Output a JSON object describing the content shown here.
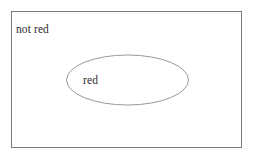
{
  "diagram": {
    "type": "euler-diagram",
    "background_color": "#ffffff",
    "universe": {
      "label": "not red",
      "shape": "rectangle",
      "stroke_color": "#7a7a7a",
      "fill": "none",
      "x": 11,
      "y": 11,
      "width": 230,
      "height": 136,
      "label_x": 16,
      "label_y": 33
    },
    "sets": [
      {
        "label": "red",
        "shape": "ellipse",
        "stroke_color": "#8e8e8e",
        "fill": "none",
        "cx": 127.5,
        "cy": 80,
        "rx": 61,
        "ry": 25,
        "label_x": 83,
        "label_y": 84
      }
    ],
    "text_color": "#2b2b2b"
  }
}
